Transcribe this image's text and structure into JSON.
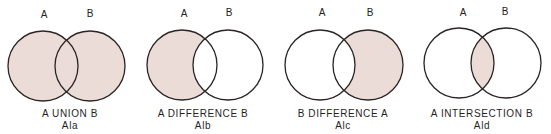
{
  "colors": {
    "fill": "#ecdcd7",
    "stroke": "#2a2424",
    "background": "#ffffff",
    "text": "#1f1f1f"
  },
  "radius": 35,
  "panels": [
    {
      "id": "union",
      "set_a_label": "A",
      "set_b_label": "B",
      "caption": "A UNION B",
      "figure_id": "Ala",
      "shaded_region": "union",
      "circle_a": {
        "cx": 43,
        "cy": 66
      },
      "circle_b": {
        "cx": 90,
        "cy": 66
      },
      "label_a_pos": {
        "x": 44,
        "y": 18
      },
      "label_b_pos": {
        "x": 90,
        "y": 17
      },
      "caption_x": 70
    },
    {
      "id": "difference-a-b",
      "set_a_label": "A",
      "set_b_label": "B",
      "caption": "A DIFFERENCE B",
      "figure_id": "Alb",
      "shaded_region": "a_minus_b",
      "circle_a": {
        "cx": 182,
        "cy": 65
      },
      "circle_b": {
        "cx": 228,
        "cy": 65
      },
      "label_a_pos": {
        "x": 184,
        "y": 17
      },
      "label_b_pos": {
        "x": 229,
        "y": 16
      },
      "caption_x": 203
    },
    {
      "id": "difference-b-a",
      "set_a_label": "A",
      "set_b_label": "B",
      "caption": "B DIFFERENCE A",
      "figure_id": "Alc",
      "shaded_region": "b_minus_a",
      "circle_a": {
        "cx": 320,
        "cy": 65
      },
      "circle_b": {
        "cx": 368,
        "cy": 65
      },
      "label_a_pos": {
        "x": 322,
        "y": 16
      },
      "label_b_pos": {
        "x": 370,
        "y": 16
      },
      "caption_x": 343
    },
    {
      "id": "intersection",
      "set_a_label": "A",
      "set_b_label": "B",
      "caption": "A INTERSECTION B",
      "figure_id": "Ald",
      "shaded_region": "intersection",
      "circle_a": {
        "cx": 459,
        "cy": 63
      },
      "circle_b": {
        "cx": 506,
        "cy": 63
      },
      "label_a_pos": {
        "x": 463,
        "y": 16
      },
      "label_b_pos": {
        "x": 505,
        "y": 15
      },
      "caption_x": 482
    }
  ]
}
